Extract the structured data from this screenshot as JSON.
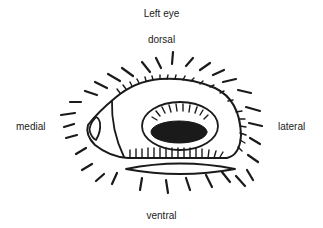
{
  "figure": {
    "title": "Left eye",
    "orientation_labels": {
      "top": "dorsal",
      "left": "medial",
      "right": "lateral",
      "bottom": "ventral"
    }
  },
  "colors": {
    "ink": "#1a1a1a",
    "background": "#ffffff"
  }
}
